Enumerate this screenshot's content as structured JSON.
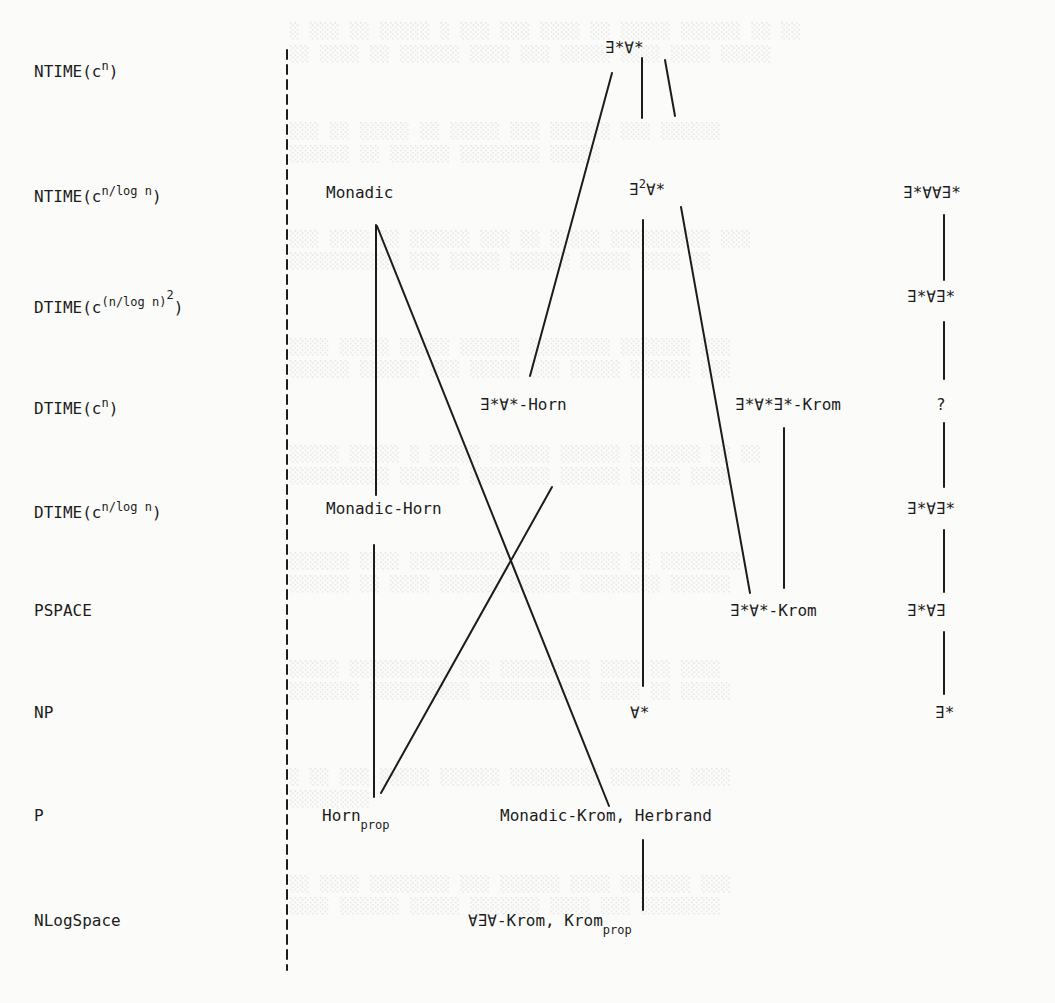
{
  "diagram": {
    "type": "complexity-hierarchy",
    "complexity_classes": [
      {
        "id": "ntime_cn",
        "base": "NTIME(c",
        "sup": "n",
        "close": ")"
      },
      {
        "id": "ntime_cn_logn",
        "base": "NTIME(c",
        "sup": "n/log n",
        "close": ")"
      },
      {
        "id": "dtime_cn_logn_sq",
        "base": "DTIME(c",
        "sup": "(n/log n)",
        "sup2": "2",
        "close": ")"
      },
      {
        "id": "dtime_cn",
        "base": "DTIME(c",
        "sup": "n",
        "close": ")"
      },
      {
        "id": "dtime_cn_logn2",
        "base": "DTIME(c",
        "sup": "n/log n",
        "close": ")"
      },
      {
        "id": "pspace",
        "base": "PSPACE"
      },
      {
        "id": "np",
        "base": "NP"
      },
      {
        "id": "p",
        "base": "P"
      },
      {
        "id": "nlogspace",
        "base": "NLogSpace"
      }
    ],
    "nodes": {
      "monadic": "Monadic",
      "ea_star": "∃*∀*",
      "e2a_star": "∃²∀*",
      "e2_sup": "2",
      "e2_rest": "∀*",
      "e_star_a_a_e_star": "∃*∀∀∃*",
      "e_star_a_e_star_1": "∃*∀∃*",
      "ea_horn": "∃*∀*-Horn",
      "eae_krom": "∃*∀*∃*-Krom",
      "question": "?",
      "monadic_horn": "Monadic-Horn",
      "e_star_a_e_star_2": "∃*∀∃*",
      "ea_krom": "∃*∀*-Krom",
      "e_star_a_e": "∃*∀∃",
      "a_star": "∀*",
      "e_star": "∃*",
      "horn": "Horn",
      "horn_sub": "prop",
      "monadic_krom_herbrand": "Monadic-Krom, Herbrand",
      "aea_krom": "∀∃∀-Krom, Krom",
      "krom_sub": "prop"
    },
    "edges": [
      [
        "∃*∀*",
        "∃²∀*"
      ],
      [
        "∃*∀*",
        "∃*∀*-Horn"
      ],
      [
        "∃*∀*",
        "∃*∀*∃*-Krom"
      ],
      [
        "∃²∀*",
        "∀*"
      ],
      [
        "∃²∀*",
        "∃*∀*-Krom"
      ],
      [
        "Monadic",
        "Horn_prop"
      ],
      [
        "Monadic",
        "Monadic-Krom, Herbrand"
      ],
      [
        "∃*∀*-Horn",
        "Horn_prop"
      ],
      [
        "∃*∀*∃*-Krom",
        "∃*∀*-Krom"
      ],
      [
        "∃*∀∀∃*",
        "∃*∀∃*"
      ],
      [
        "∃*∀∃*",
        "?"
      ],
      [
        "?",
        "∃*∀∃*"
      ],
      [
        "∃*∀∃*",
        "∃*∀∃"
      ],
      [
        "∃*∀∃",
        "∃*"
      ],
      [
        "∀*",
        "∀∃∀-Krom, Krom_prop"
      ]
    ]
  },
  "colors": {
    "ink": "#1c1c1c",
    "paper": "#fbfbfa",
    "bleed_through": "#e3e3e0"
  }
}
